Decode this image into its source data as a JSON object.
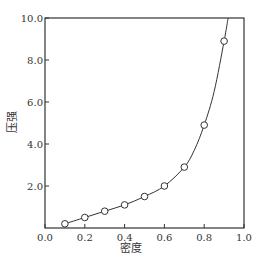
{
  "chart_data": {
    "type": "line",
    "title": "",
    "xlabel": "密度",
    "ylabel": "压强",
    "xlim": [
      0.0,
      1.0
    ],
    "ylim": [
      0.0,
      10.0
    ],
    "grid": false,
    "legend": null,
    "x_ticks": [
      "0.0",
      "0.2",
      "0.4",
      "0.6",
      "0.8",
      "1.0"
    ],
    "y_ticks": [
      "2.0",
      "4.0",
      "6.0",
      "8.0",
      "10.0"
    ],
    "series": [
      {
        "name": "data",
        "style": "open-circle-markers",
        "x": [
          0.1,
          0.2,
          0.3,
          0.4,
          0.5,
          0.6,
          0.7,
          0.8,
          0.9
        ],
        "y": [
          0.2,
          0.5,
          0.8,
          1.1,
          1.5,
          2.0,
          2.9,
          4.9,
          8.9
        ]
      },
      {
        "name": "fit",
        "style": "solid-line",
        "x": [
          0.1,
          0.2,
          0.3,
          0.4,
          0.5,
          0.6,
          0.7,
          0.75,
          0.8,
          0.85,
          0.9,
          0.92
        ],
        "y": [
          0.2,
          0.5,
          0.8,
          1.1,
          1.5,
          2.0,
          2.9,
          3.7,
          4.9,
          6.5,
          8.9,
          10.0
        ]
      }
    ],
    "colors": {
      "line": "#333333",
      "axes": "#333333",
      "marker": "#333333"
    }
  }
}
